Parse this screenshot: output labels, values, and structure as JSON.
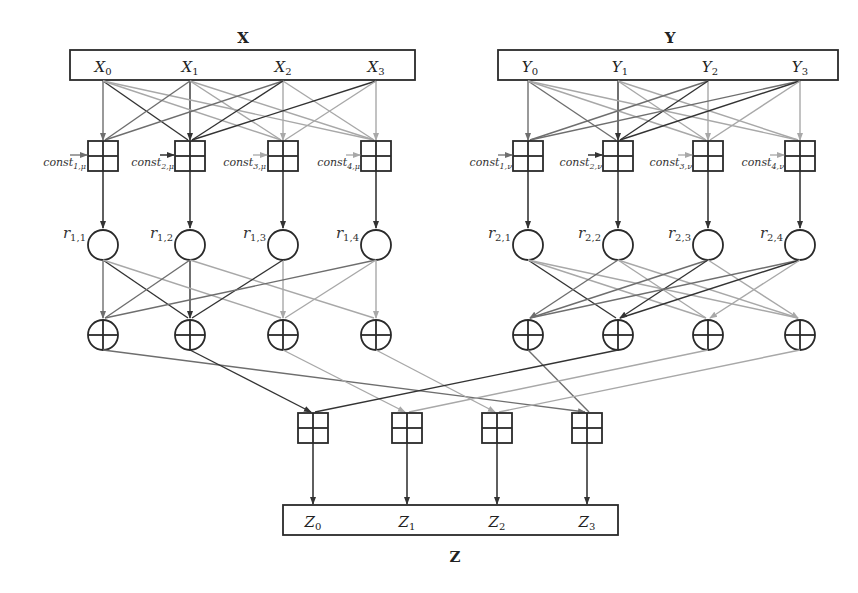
{
  "inputs": {
    "x": {
      "title": "X",
      "cells": [
        {
          "base": "X",
          "sub": "0"
        },
        {
          "base": "X",
          "sub": "1"
        },
        {
          "base": "X",
          "sub": "2"
        },
        {
          "base": "X",
          "sub": "3"
        }
      ]
    },
    "y": {
      "title": "Y",
      "cells": [
        {
          "base": "Y",
          "sub": "0"
        },
        {
          "base": "Y",
          "sub": "1"
        },
        {
          "base": "Y",
          "sub": "2"
        },
        {
          "base": "Y",
          "sub": "3"
        }
      ]
    }
  },
  "constants": {
    "x": [
      {
        "base": "const",
        "sub": "1,μ"
      },
      {
        "base": "const",
        "sub": "2,μ"
      },
      {
        "base": "const",
        "sub": "3,μ"
      },
      {
        "base": "const",
        "sub": "4,μ"
      }
    ],
    "y": [
      {
        "base": "const",
        "sub": "1,ν"
      },
      {
        "base": "const",
        "sub": "2,ν"
      },
      {
        "base": "const",
        "sub": "3,ν"
      },
      {
        "base": "const",
        "sub": "4,ν"
      }
    ]
  },
  "registers": {
    "x": [
      {
        "base": "r",
        "sub": "1,1"
      },
      {
        "base": "r",
        "sub": "1,2"
      },
      {
        "base": "r",
        "sub": "1,3"
      },
      {
        "base": "r",
        "sub": "1,4"
      }
    ],
    "y": [
      {
        "base": "r",
        "sub": "2,1"
      },
      {
        "base": "r",
        "sub": "2,2"
      },
      {
        "base": "r",
        "sub": "2,3"
      },
      {
        "base": "r",
        "sub": "2,4"
      }
    ]
  },
  "output": {
    "title": "Z",
    "cells": [
      {
        "base": "Z",
        "sub": "0"
      },
      {
        "base": "Z",
        "sub": "1"
      },
      {
        "base": "Z",
        "sub": "2"
      },
      {
        "base": "Z",
        "sub": "3"
      }
    ]
  },
  "colors": {
    "dark": "#333333",
    "medium": "#6e6e6e",
    "light": "#a8a8a8",
    "box": "#2a2a2a"
  }
}
